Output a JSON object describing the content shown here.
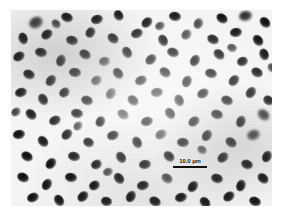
{
  "figure": {
    "kind": "light-micrograph",
    "background_color": "#f7f7f5",
    "cell_color": "#111111",
    "page_color": "#ffffff"
  },
  "scale_bar": {
    "label": "10.0 µm",
    "value": 10.0,
    "unit": "µm",
    "bar_color": "#111111",
    "bar_length_px": 34,
    "position": "lower-center-right"
  },
  "cells": [
    {
      "x": 18,
      "y": 7,
      "w": 14,
      "h": 11,
      "rot": -28,
      "style": "blob"
    },
    {
      "x": 50,
      "y": 3,
      "w": 12,
      "h": 9,
      "rot": 22,
      "style": "solid"
    },
    {
      "x": 80,
      "y": 5,
      "w": 12,
      "h": 9,
      "rot": -15,
      "style": "solid"
    },
    {
      "x": 102,
      "y": 1,
      "w": 11,
      "h": 9,
      "rot": 58,
      "style": "solid"
    },
    {
      "x": 130,
      "y": 8,
      "w": 12,
      "h": 9,
      "rot": -42,
      "style": "solid"
    },
    {
      "x": 158,
      "y": 2,
      "w": 12,
      "h": 9,
      "rot": 10,
      "style": "solid"
    },
    {
      "x": 182,
      "y": 9,
      "w": 11,
      "h": 9,
      "rot": -62,
      "style": "dim"
    },
    {
      "x": 205,
      "y": 4,
      "w": 12,
      "h": 9,
      "rot": 35,
      "style": "solid"
    },
    {
      "x": 228,
      "y": 1,
      "w": 13,
      "h": 10,
      "rot": -10,
      "style": "blob"
    },
    {
      "x": 248,
      "y": 8,
      "w": 12,
      "h": 9,
      "rot": 48,
      "style": "solid"
    },
    {
      "x": 6,
      "y": 24,
      "w": 12,
      "h": 9,
      "rot": 72,
      "style": "solid"
    },
    {
      "x": 30,
      "y": 20,
      "w": 12,
      "h": 9,
      "rot": -35,
      "style": "solid"
    },
    {
      "x": 55,
      "y": 26,
      "w": 12,
      "h": 9,
      "rot": 18,
      "style": "solid"
    },
    {
      "x": 74,
      "y": 18,
      "w": 11,
      "h": 9,
      "rot": -55,
      "style": "solid"
    },
    {
      "x": 96,
      "y": 24,
      "w": 12,
      "h": 9,
      "rot": 40,
      "style": "solid"
    },
    {
      "x": 120,
      "y": 19,
      "w": 12,
      "h": 9,
      "rot": -20,
      "style": "solid"
    },
    {
      "x": 146,
      "y": 26,
      "w": 12,
      "h": 9,
      "rot": 65,
      "style": "solid"
    },
    {
      "x": 170,
      "y": 20,
      "w": 11,
      "h": 9,
      "rot": -48,
      "style": "dim"
    },
    {
      "x": 196,
      "y": 25,
      "w": 12,
      "h": 9,
      "rot": 28,
      "style": "solid"
    },
    {
      "x": 219,
      "y": 18,
      "w": 12,
      "h": 9,
      "rot": -8,
      "style": "solid"
    },
    {
      "x": 241,
      "y": 26,
      "w": 12,
      "h": 9,
      "rot": 52,
      "style": "solid"
    },
    {
      "x": 2,
      "y": 42,
      "w": 12,
      "h": 9,
      "rot": -30,
      "style": "solid"
    },
    {
      "x": 24,
      "y": 38,
      "w": 12,
      "h": 9,
      "rot": 14,
      "style": "solid"
    },
    {
      "x": 44,
      "y": 46,
      "w": 12,
      "h": 9,
      "rot": -68,
      "style": "solid"
    },
    {
      "x": 68,
      "y": 40,
      "w": 12,
      "h": 9,
      "rot": 32,
      "style": "solid"
    },
    {
      "x": 88,
      "y": 47,
      "w": 11,
      "h": 9,
      "rot": -12,
      "style": "dim"
    },
    {
      "x": 110,
      "y": 38,
      "w": 12,
      "h": 9,
      "rot": 60,
      "style": "solid"
    },
    {
      "x": 134,
      "y": 45,
      "w": 12,
      "h": 9,
      "rot": -40,
      "style": "solid"
    },
    {
      "x": 156,
      "y": 38,
      "w": 12,
      "h": 9,
      "rot": 22,
      "style": "solid"
    },
    {
      "x": 178,
      "y": 46,
      "w": 12,
      "h": 9,
      "rot": -58,
      "style": "solid"
    },
    {
      "x": 202,
      "y": 40,
      "w": 12,
      "h": 9,
      "rot": 44,
      "style": "solid"
    },
    {
      "x": 226,
      "y": 47,
      "w": 11,
      "h": 9,
      "rot": -18,
      "style": "solid"
    },
    {
      "x": 247,
      "y": 40,
      "w": 12,
      "h": 9,
      "rot": 70,
      "style": "solid"
    },
    {
      "x": 12,
      "y": 60,
      "w": 12,
      "h": 9,
      "rot": 26,
      "style": "solid"
    },
    {
      "x": 34,
      "y": 66,
      "w": 12,
      "h": 9,
      "rot": -50,
      "style": "solid"
    },
    {
      "x": 58,
      "y": 58,
      "w": 12,
      "h": 9,
      "rot": 8,
      "style": "solid"
    },
    {
      "x": 80,
      "y": 66,
      "w": 11,
      "h": 9,
      "rot": -34,
      "style": "dim"
    },
    {
      "x": 101,
      "y": 59,
      "w": 12,
      "h": 9,
      "rot": 54,
      "style": "solid"
    },
    {
      "x": 124,
      "y": 66,
      "w": 12,
      "h": 9,
      "rot": -22,
      "style": "solid"
    },
    {
      "x": 148,
      "y": 58,
      "w": 12,
      "h": 9,
      "rot": 38,
      "style": "solid"
    },
    {
      "x": 170,
      "y": 67,
      "w": 12,
      "h": 9,
      "rot": -64,
      "style": "solid"
    },
    {
      "x": 194,
      "y": 59,
      "w": 12,
      "h": 9,
      "rot": 16,
      "style": "solid"
    },
    {
      "x": 217,
      "y": 66,
      "w": 12,
      "h": 9,
      "rot": -46,
      "style": "solid"
    },
    {
      "x": 240,
      "y": 58,
      "w": 12,
      "h": 9,
      "rot": 30,
      "style": "solid"
    },
    {
      "x": 4,
      "y": 78,
      "w": 12,
      "h": 9,
      "rot": -16,
      "style": "solid"
    },
    {
      "x": 26,
      "y": 85,
      "w": 12,
      "h": 9,
      "rot": 62,
      "style": "solid"
    },
    {
      "x": 48,
      "y": 78,
      "w": 11,
      "h": 9,
      "rot": -38,
      "style": "solid"
    },
    {
      "x": 70,
      "y": 86,
      "w": 12,
      "h": 9,
      "rot": 20,
      "style": "solid"
    },
    {
      "x": 94,
      "y": 79,
      "w": 12,
      "h": 9,
      "rot": -56,
      "style": "dim"
    },
    {
      "x": 116,
      "y": 86,
      "w": 12,
      "h": 9,
      "rot": 42,
      "style": "solid"
    },
    {
      "x": 140,
      "y": 78,
      "w": 12,
      "h": 9,
      "rot": -6,
      "style": "solid"
    },
    {
      "x": 162,
      "y": 86,
      "w": 12,
      "h": 9,
      "rot": 68,
      "style": "solid"
    },
    {
      "x": 186,
      "y": 79,
      "w": 12,
      "h": 9,
      "rot": -28,
      "style": "solid"
    },
    {
      "x": 210,
      "y": 86,
      "w": 12,
      "h": 9,
      "rot": 24,
      "style": "solid"
    },
    {
      "x": 234,
      "y": 78,
      "w": 12,
      "h": 9,
      "rot": -52,
      "style": "solid"
    },
    {
      "x": 252,
      "y": 86,
      "w": 11,
      "h": 9,
      "rot": 36,
      "style": "solid"
    },
    {
      "x": 14,
      "y": 100,
      "w": 12,
      "h": 9,
      "rot": 46,
      "style": "solid"
    },
    {
      "x": 38,
      "y": 106,
      "w": 12,
      "h": 9,
      "rot": -24,
      "style": "solid"
    },
    {
      "x": 60,
      "y": 99,
      "w": 12,
      "h": 9,
      "rot": 12,
      "style": "solid"
    },
    {
      "x": 84,
      "y": 107,
      "w": 11,
      "h": 9,
      "rot": -60,
      "style": "solid"
    },
    {
      "x": 106,
      "y": 100,
      "w": 12,
      "h": 9,
      "rot": 34,
      "style": "dim"
    },
    {
      "x": 130,
      "y": 107,
      "w": 12,
      "h": 9,
      "rot": -14,
      "style": "solid"
    },
    {
      "x": 153,
      "y": 99,
      "w": 12,
      "h": 9,
      "rot": 56,
      "style": "solid"
    },
    {
      "x": 177,
      "y": 107,
      "w": 12,
      "h": 9,
      "rot": -36,
      "style": "solid"
    },
    {
      "x": 200,
      "y": 100,
      "w": 12,
      "h": 9,
      "rot": 18,
      "style": "solid"
    },
    {
      "x": 224,
      "y": 107,
      "w": 12,
      "h": 9,
      "rot": -66,
      "style": "solid"
    },
    {
      "x": 246,
      "y": 100,
      "w": 13,
      "h": 10,
      "rot": 40,
      "style": "blob"
    },
    {
      "x": 2,
      "y": 120,
      "w": 12,
      "h": 9,
      "rot": -10,
      "style": "solid"
    },
    {
      "x": 26,
      "y": 127,
      "w": 12,
      "h": 9,
      "rot": 50,
      "style": "solid"
    },
    {
      "x": 50,
      "y": 120,
      "w": 12,
      "h": 9,
      "rot": -44,
      "style": "solid"
    },
    {
      "x": 72,
      "y": 128,
      "w": 11,
      "h": 9,
      "rot": 28,
      "style": "solid"
    },
    {
      "x": 96,
      "y": 121,
      "w": 12,
      "h": 9,
      "rot": -18,
      "style": "solid"
    },
    {
      "x": 120,
      "y": 128,
      "w": 12,
      "h": 9,
      "rot": 64,
      "style": "solid"
    },
    {
      "x": 144,
      "y": 120,
      "w": 12,
      "h": 9,
      "rot": -32,
      "style": "dim"
    },
    {
      "x": 166,
      "y": 128,
      "w": 12,
      "h": 9,
      "rot": 6,
      "style": "solid"
    },
    {
      "x": 190,
      "y": 121,
      "w": 12,
      "h": 9,
      "rot": -54,
      "style": "solid"
    },
    {
      "x": 214,
      "y": 128,
      "w": 12,
      "h": 9,
      "rot": 38,
      "style": "solid"
    },
    {
      "x": 236,
      "y": 120,
      "w": 13,
      "h": 10,
      "rot": -20,
      "style": "blob"
    },
    {
      "x": 10,
      "y": 142,
      "w": 12,
      "h": 9,
      "rot": 32,
      "style": "solid"
    },
    {
      "x": 34,
      "y": 149,
      "w": 12,
      "h": 9,
      "rot": -48,
      "style": "solid"
    },
    {
      "x": 57,
      "y": 142,
      "w": 12,
      "h": 9,
      "rot": 14,
      "style": "solid"
    },
    {
      "x": 80,
      "y": 150,
      "w": 11,
      "h": 9,
      "rot": -26,
      "style": "solid"
    },
    {
      "x": 104,
      "y": 143,
      "w": 12,
      "h": 9,
      "rot": 58,
      "style": "solid"
    },
    {
      "x": 128,
      "y": 150,
      "w": 12,
      "h": 9,
      "rot": -8,
      "style": "solid"
    },
    {
      "x": 152,
      "y": 142,
      "w": 12,
      "h": 9,
      "rot": 44,
      "style": "solid"
    },
    {
      "x": 206,
      "y": 143,
      "w": 12,
      "h": 9,
      "rot": -40,
      "style": "solid"
    },
    {
      "x": 230,
      "y": 150,
      "w": 12,
      "h": 9,
      "rot": 22,
      "style": "solid"
    },
    {
      "x": 250,
      "y": 142,
      "w": 12,
      "h": 9,
      "rot": -62,
      "style": "solid"
    },
    {
      "x": 6,
      "y": 163,
      "w": 12,
      "h": 9,
      "rot": 26,
      "style": "solid"
    },
    {
      "x": 30,
      "y": 170,
      "w": 12,
      "h": 9,
      "rot": -56,
      "style": "solid"
    },
    {
      "x": 54,
      "y": 163,
      "w": 12,
      "h": 9,
      "rot": 10,
      "style": "solid"
    },
    {
      "x": 78,
      "y": 171,
      "w": 11,
      "h": 9,
      "rot": -30,
      "style": "solid"
    },
    {
      "x": 102,
      "y": 164,
      "w": 12,
      "h": 9,
      "rot": 52,
      "style": "solid"
    },
    {
      "x": 126,
      "y": 171,
      "w": 12,
      "h": 9,
      "rot": -12,
      "style": "solid"
    },
    {
      "x": 150,
      "y": 164,
      "w": 12,
      "h": 9,
      "rot": 36,
      "style": "dim"
    },
    {
      "x": 176,
      "y": 172,
      "w": 12,
      "h": 9,
      "rot": -50,
      "style": "solid"
    },
    {
      "x": 200,
      "y": 164,
      "w": 12,
      "h": 9,
      "rot": 20,
      "style": "solid"
    },
    {
      "x": 224,
      "y": 171,
      "w": 12,
      "h": 9,
      "rot": -68,
      "style": "solid"
    },
    {
      "x": 246,
      "y": 164,
      "w": 12,
      "h": 9,
      "rot": 42,
      "style": "solid"
    },
    {
      "x": 16,
      "y": 183,
      "w": 12,
      "h": 9,
      "rot": -22,
      "style": "solid"
    },
    {
      "x": 42,
      "y": 186,
      "w": 12,
      "h": 9,
      "rot": 60,
      "style": "solid"
    },
    {
      "x": 66,
      "y": 182,
      "w": 12,
      "h": 9,
      "rot": -42,
      "style": "solid"
    },
    {
      "x": 90,
      "y": 187,
      "w": 11,
      "h": 9,
      "rot": 16,
      "style": "solid"
    },
    {
      "x": 114,
      "y": 182,
      "w": 12,
      "h": 9,
      "rot": -58,
      "style": "solid"
    },
    {
      "x": 138,
      "y": 187,
      "w": 12,
      "h": 9,
      "rot": 30,
      "style": "solid"
    },
    {
      "x": 164,
      "y": 183,
      "w": 12,
      "h": 9,
      "rot": -14,
      "style": "solid"
    },
    {
      "x": 188,
      "y": 188,
      "w": 12,
      "h": 9,
      "rot": 48,
      "style": "solid"
    },
    {
      "x": 212,
      "y": 182,
      "w": 12,
      "h": 9,
      "rot": -34,
      "style": "solid"
    },
    {
      "x": 238,
      "y": 187,
      "w": 12,
      "h": 9,
      "rot": 24,
      "style": "solid"
    },
    {
      "x": 40,
      "y": 10,
      "w": 10,
      "h": 8,
      "rot": 44,
      "style": "dim"
    },
    {
      "x": 144,
      "y": 12,
      "w": 10,
      "h": 8,
      "rot": -26,
      "style": "dim"
    },
    {
      "x": 216,
      "y": 34,
      "w": 10,
      "h": 8,
      "rot": 18,
      "style": "dim"
    },
    {
      "x": 62,
      "y": 112,
      "w": 10,
      "h": 8,
      "rot": -46,
      "style": "dim"
    },
    {
      "x": 186,
      "y": 136,
      "w": 10,
      "h": 8,
      "rot": 34,
      "style": "dim"
    },
    {
      "x": 92,
      "y": 158,
      "w": 10,
      "h": 8,
      "rot": -20,
      "style": "dim"
    },
    {
      "x": 256,
      "y": 54,
      "w": 10,
      "h": 8,
      "rot": 50,
      "style": "dim"
    },
    {
      "x": 0,
      "y": 98,
      "w": 10,
      "h": 8,
      "rot": -38,
      "style": "dim"
    }
  ]
}
